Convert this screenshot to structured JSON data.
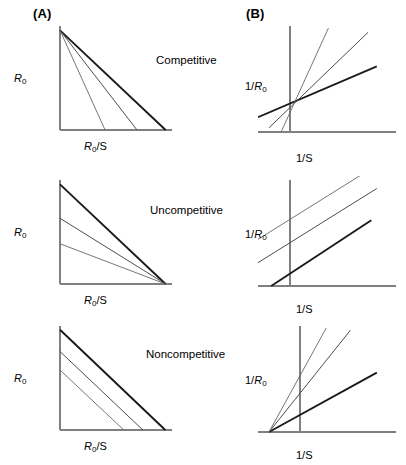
{
  "figure": {
    "panels": {
      "a_header": "(A)",
      "b_header": "(B)"
    },
    "rows": [
      {
        "name": "competitive",
        "label": "Competitive",
        "a_ylabel_main": "R",
        "a_ylabel_sub": "0",
        "a_xlabel_main": "R",
        "a_xlabel_sub": "0",
        "a_xlabel_tail": "/S",
        "b_ylabel_pre": "1/",
        "b_ylabel_main": "R",
        "b_ylabel_sub": "0",
        "b_xlabel": "1/S"
      },
      {
        "name": "uncompetitive",
        "label": "Uncompetitive",
        "a_ylabel_main": "R",
        "a_ylabel_sub": "0",
        "a_xlabel_main": "R",
        "a_xlabel_sub": "0",
        "a_xlabel_tail": "/S",
        "b_ylabel_pre": "1/",
        "b_ylabel_main": "R",
        "b_ylabel_sub": "0",
        "b_xlabel": "1/S"
      },
      {
        "name": "noncompetitive",
        "label": "Noncompetitive",
        "a_ylabel_main": "R",
        "a_ylabel_sub": "0",
        "a_xlabel_main": "R",
        "a_xlabel_sub": "0",
        "a_xlabel_tail": "/S",
        "b_ylabel_pre": "1/",
        "b_ylabel_main": "R",
        "b_ylabel_sub": "0",
        "b_xlabel": "1/S"
      }
    ]
  },
  "chart_data": [
    {
      "id": "competitive-a",
      "type": "line",
      "title": "Competitive (A)",
      "xlabel": "R0/S",
      "ylabel": "R0",
      "description": "Eadie-Hofstee style: three lines share a common y-intercept (same Rmax) and have progressively shallower slopes, giving different x-intercepts.",
      "axis_origin": [
        0,
        0
      ],
      "xlim": [
        0,
        100
      ],
      "ylim": [
        0,
        100
      ],
      "series": [
        {
          "name": "no inhibitor",
          "weight": "thick",
          "x": [
            0,
            96
          ],
          "y": [
            94,
            0
          ]
        },
        {
          "name": "inhibitor low",
          "weight": "mid",
          "x": [
            0,
            70
          ],
          "y": [
            94,
            0
          ]
        },
        {
          "name": "inhibitor high",
          "weight": "thin",
          "x": [
            0,
            41
          ],
          "y": [
            94,
            0
          ]
        }
      ]
    },
    {
      "id": "competitive-b",
      "type": "line",
      "title": "Competitive (B)",
      "xlabel": "1/S",
      "ylabel": "1/R0",
      "description": "Lineweaver-Burk style: three lines of increasing slope intersect at a common point on the positive y-axis (same 1/Rmax intercept).",
      "axis_origin": [
        32,
        0
      ],
      "xlim": [
        0,
        110
      ],
      "ylim": [
        0,
        100
      ],
      "series": [
        {
          "name": "no inhibitor",
          "weight": "thick",
          "x": [
            0,
            108
          ],
          "y": [
            14,
            62
          ]
        },
        {
          "name": "inhibitor low",
          "weight": "mid",
          "x": [
            10,
            100
          ],
          "y": [
            4,
            94
          ]
        },
        {
          "name": "inhibitor high",
          "weight": "thin",
          "x": [
            21,
            64
          ],
          "y": [
            0,
            98
          ]
        }
      ],
      "intersection": [
        32,
        33
      ]
    },
    {
      "id": "uncompetitive-a",
      "type": "line",
      "title": "Uncompetitive (A)",
      "xlabel": "R0/S",
      "ylabel": "R0",
      "description": "Three lines converge on a single common x-intercept with progressively lower y-intercepts.",
      "axis_origin": [
        0,
        0
      ],
      "xlim": [
        0,
        100
      ],
      "ylim": [
        0,
        100
      ],
      "series": [
        {
          "name": "no inhibitor",
          "weight": "thick",
          "x": [
            0,
            96
          ],
          "y": [
            94,
            0
          ]
        },
        {
          "name": "inhibitor low",
          "weight": "mid",
          "x": [
            0,
            96
          ],
          "y": [
            62,
            0
          ]
        },
        {
          "name": "inhibitor high",
          "weight": "thin",
          "x": [
            0,
            96
          ],
          "y": [
            38,
            0
          ]
        }
      ],
      "common_x_intercept": 96
    },
    {
      "id": "uncompetitive-b",
      "type": "line",
      "title": "Uncompetitive (B)",
      "xlabel": "1/S",
      "ylabel": "1/R0",
      "description": "Three parallel lines of identical slope, offset vertically by increasing inhibitor concentration.",
      "axis_origin": [
        32,
        0
      ],
      "xlim": [
        0,
        110
      ],
      "ylim": [
        0,
        100
      ],
      "series": [
        {
          "name": "no inhibitor",
          "weight": "thick",
          "x": [
            12,
            103
          ],
          "y": [
            0,
            62
          ]
        },
        {
          "name": "inhibitor low",
          "weight": "mid",
          "x": [
            0,
            108
          ],
          "y": [
            22,
            92
          ]
        },
        {
          "name": "inhibitor high",
          "weight": "thin",
          "x": [
            0,
            108
          ],
          "y": [
            44,
            114
          ]
        }
      ],
      "parallel": true
    },
    {
      "id": "noncompetitive-a",
      "type": "line",
      "title": "Noncompetitive (A)",
      "xlabel": "R0/S",
      "ylabel": "R0",
      "description": "Three parallel descending lines with identical slope; both y-intercept and x-intercept decrease with inhibitor.",
      "axis_origin": [
        0,
        0
      ],
      "xlim": [
        0,
        100
      ],
      "ylim": [
        0,
        100
      ],
      "series": [
        {
          "name": "no inhibitor",
          "weight": "thick",
          "x": [
            0,
            94
          ],
          "y": [
            92,
            0
          ]
        },
        {
          "name": "inhibitor low",
          "weight": "mid",
          "x": [
            0,
            74
          ],
          "y": [
            72,
            0
          ]
        },
        {
          "name": "inhibitor high",
          "weight": "thin",
          "x": [
            0,
            57
          ],
          "y": [
            55,
            0
          ]
        }
      ],
      "parallel": true
    },
    {
      "id": "noncompetitive-b",
      "type": "line",
      "title": "Noncompetitive (B)",
      "xlabel": "1/S",
      "ylabel": "1/R0",
      "description": "Three lines of increasing slope intersect at a common point on the negative x-axis (same -1/Km).",
      "axis_origin": [
        42,
        0
      ],
      "xlim": [
        0,
        110
      ],
      "ylim": [
        0,
        100
      ],
      "series": [
        {
          "name": "no inhibitor",
          "weight": "thick",
          "x": [
            10,
            108
          ],
          "y": [
            0,
            56
          ]
        },
        {
          "name": "inhibitor low",
          "weight": "mid",
          "x": [
            10,
            84
          ],
          "y": [
            0,
            96
          ]
        },
        {
          "name": "inhibitor high",
          "weight": "thin",
          "x": [
            10,
            62
          ],
          "y": [
            0,
            98
          ]
        }
      ],
      "intersection": [
        10,
        0
      ]
    }
  ]
}
